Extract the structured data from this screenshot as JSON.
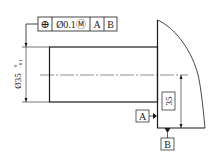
{
  "drawing": {
    "type": "engineering-drawing",
    "feature_control_frame": {
      "symbol": "⊕",
      "symbol_name": "position-symbol",
      "tolerance": "Ø0.1Ⓜ",
      "datum_primary": "A",
      "datum_secondary": "B"
    },
    "diameter_dimension": {
      "nominal": "Ø35",
      "upper_deviation": "0",
      "lower_deviation": "-0.1"
    },
    "basic_dimension": {
      "value": "35"
    },
    "datums": [
      {
        "label": "A"
      },
      {
        "label": "B"
      }
    ],
    "colors": {
      "line": "#1a1a1a",
      "background": "#ffffff"
    }
  }
}
